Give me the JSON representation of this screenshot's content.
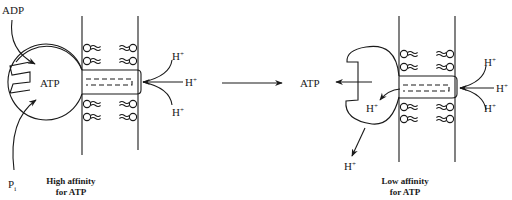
{
  "diagram": {
    "left_state": {
      "enzyme_label": "ATP",
      "inputs": [
        {
          "label": "ADP"
        },
        {
          "label": "P",
          "subscript": "i"
        }
      ],
      "protons": [
        "H",
        "H",
        "H"
      ],
      "proton_superscript": "+",
      "caption_line1": "High affinity",
      "caption_line2": "for ATP"
    },
    "transition_arrow": "right-arrow",
    "right_state": {
      "released_label": "ATP",
      "inner_proton": "H",
      "released_proton": "H",
      "protons": [
        "H",
        "H",
        "H"
      ],
      "proton_superscript": "+",
      "caption_line1": "Low affinity",
      "caption_line2": "for ATP"
    },
    "colors": {
      "ink": "#1a1a1a",
      "background": "#ffffff"
    }
  }
}
